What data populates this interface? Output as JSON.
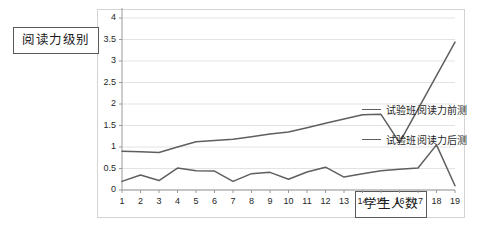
{
  "chart_data": {
    "type": "line",
    "title": "",
    "xlabel": "学生人数",
    "ylabel": "阅读力级别",
    "x": [
      1,
      2,
      3,
      4,
      5,
      6,
      7,
      8,
      9,
      10,
      11,
      12,
      13,
      14,
      15,
      16,
      17,
      18,
      19
    ],
    "xtick_labels": [
      "1",
      "2",
      "3",
      "4",
      "5",
      "6",
      "7",
      "8",
      "9",
      "10",
      "11",
      "12",
      "13",
      "14",
      "15",
      "16",
      "17",
      "18",
      "19"
    ],
    "ytick_labels": [
      "0",
      "0.5",
      "1",
      "1.5",
      "2",
      "2.5",
      "3",
      "3.5",
      "4"
    ],
    "yticks": [
      0,
      0.5,
      1,
      1.5,
      2,
      2.5,
      3,
      3.5,
      4
    ],
    "ylim": [
      0,
      4
    ],
    "xlim": [
      1,
      19
    ],
    "grid": "horizontal",
    "legend_position": "right",
    "series": [
      {
        "name": "试验班阅读力前测",
        "color": "#5f5f5f",
        "values": [
          0.2,
          0.35,
          0.22,
          0.51,
          0.45,
          0.44,
          0.2,
          0.38,
          0.41,
          0.25,
          0.42,
          0.53,
          0.3,
          0.38,
          0.45,
          0.48,
          0.51,
          1.05,
          0.1
        ]
      },
      {
        "name": "试验班阅读力后测",
        "color": "#5f5f5f",
        "values": [
          0.9,
          0.89,
          0.87,
          1.0,
          1.12,
          1.15,
          1.18,
          1.24,
          1.3,
          1.35,
          1.45,
          1.55,
          1.65,
          1.75,
          1.76,
          1.1,
          1.88,
          2.66,
          3.44
        ]
      }
    ]
  },
  "labels": {
    "y_axis_box": "阅读力级别",
    "x_axis_box": "学生人数"
  },
  "legend": {
    "items": [
      {
        "label": "试验班阅读力前测"
      },
      {
        "label": "试验班阅读力后测"
      }
    ]
  }
}
